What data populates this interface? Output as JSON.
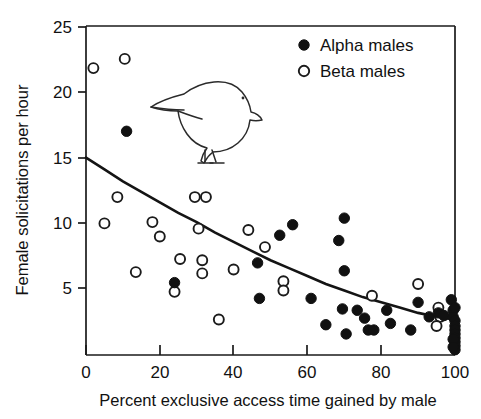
{
  "chart_data": {
    "type": "scatter",
    "title": "",
    "xlabel": "Percent exclusive access time gained by male",
    "ylabel": "Female solicitations per hour",
    "xlim": [
      0,
      100
    ],
    "ylim": [
      0,
      25
    ],
    "xticks": [
      0,
      20,
      40,
      60,
      80,
      100
    ],
    "yticks": [
      5,
      10,
      15,
      20,
      25
    ],
    "grid": false,
    "legend_position": "top-right",
    "legend": [
      {
        "label": "Alpha males",
        "marker": "filled-circle",
        "color": "#111111"
      },
      {
        "label": "Beta males",
        "marker": "open-circle",
        "color": "#ffffff"
      }
    ],
    "series": [
      {
        "name": "Alpha males",
        "marker": "filled-circle",
        "points": [
          [
            11.0,
            17.0
          ],
          [
            24.0,
            5.5
          ],
          [
            46.5,
            7.0
          ],
          [
            47.0,
            4.3
          ],
          [
            52.5,
            9.1
          ],
          [
            56.0,
            9.9
          ],
          [
            61.0,
            4.3
          ],
          [
            65.0,
            2.3
          ],
          [
            68.5,
            8.7
          ],
          [
            69.5,
            3.5
          ],
          [
            70.0,
            10.4
          ],
          [
            70.0,
            6.4
          ],
          [
            70.5,
            1.6
          ],
          [
            73.5,
            3.4
          ],
          [
            75.5,
            2.8
          ],
          [
            76.5,
            1.9
          ],
          [
            78.0,
            1.9
          ],
          [
            81.5,
            3.4
          ],
          [
            82.5,
            2.4
          ],
          [
            88.0,
            1.9
          ],
          [
            90.0,
            4.0
          ],
          [
            93.0,
            2.9
          ],
          [
            95.5,
            3.2
          ],
          [
            97.0,
            3.0
          ],
          [
            99.0,
            4.2
          ],
          [
            99.5,
            3.4
          ],
          [
            99.5,
            2.9
          ],
          [
            100.0,
            3.6
          ],
          [
            100.0,
            2.6
          ],
          [
            100.0,
            2.2
          ],
          [
            100.0,
            1.9
          ],
          [
            100.0,
            1.6
          ],
          [
            100.0,
            1.3
          ],
          [
            100.0,
            1.0
          ],
          [
            100.0,
            0.7
          ],
          [
            100.0,
            0.4
          ],
          [
            99.5,
            1.2
          ],
          [
            99.5,
            0.6
          ]
        ]
      },
      {
        "name": "Beta males",
        "marker": "open-circle",
        "points": [
          [
            2.0,
            21.8
          ],
          [
            10.5,
            22.5
          ],
          [
            5.0,
            10.0
          ],
          [
            8.5,
            12.0
          ],
          [
            13.5,
            6.3
          ],
          [
            18.0,
            10.1
          ],
          [
            20.0,
            9.0
          ],
          [
            24.0,
            4.8
          ],
          [
            25.5,
            7.3
          ],
          [
            29.5,
            12.0
          ],
          [
            30.5,
            9.6
          ],
          [
            31.5,
            7.2
          ],
          [
            31.5,
            6.2
          ],
          [
            32.5,
            12.0
          ],
          [
            36.0,
            2.7
          ],
          [
            40.0,
            6.5
          ],
          [
            44.0,
            9.5
          ],
          [
            48.5,
            8.2
          ],
          [
            53.5,
            5.6
          ],
          [
            53.5,
            4.9
          ],
          [
            77.5,
            4.5
          ],
          [
            90.0,
            5.4
          ],
          [
            95.5,
            3.6
          ],
          [
            96.0,
            2.9
          ],
          [
            95.0,
            2.2
          ]
        ]
      }
    ],
    "fit_curve": {
      "name": "exponential decay fit",
      "description": "Declining curve from 15 at x=0 to about 2.7 at x=100",
      "points": [
        [
          0,
          15.0
        ],
        [
          5,
          14.1
        ],
        [
          10,
          13.2
        ],
        [
          15,
          12.4
        ],
        [
          20,
          11.6
        ],
        [
          25,
          10.8
        ],
        [
          30,
          10.1
        ],
        [
          35,
          9.3
        ],
        [
          40,
          8.6
        ],
        [
          45,
          7.9
        ],
        [
          50,
          7.2
        ],
        [
          55,
          6.6
        ],
        [
          60,
          6.0
        ],
        [
          65,
          5.4
        ],
        [
          70,
          4.9
        ],
        [
          75,
          4.4
        ],
        [
          80,
          4.0
        ],
        [
          85,
          3.6
        ],
        [
          90,
          3.2
        ],
        [
          95,
          2.9
        ],
        [
          100,
          2.7
        ]
      ]
    },
    "annotations": [
      {
        "type": "illustration",
        "name": "bird-drawing",
        "description": "Line drawing of a small perching bird facing right"
      }
    ]
  },
  "axes": {
    "x_title": "Percent exclusive access time gained by male",
    "y_title": "Female solicitations per hour",
    "x_tick_labels": [
      "0",
      "20",
      "40",
      "60",
      "80",
      "100"
    ],
    "y_tick_labels": [
      "5",
      "10",
      "15",
      "20",
      "25"
    ]
  },
  "legend": {
    "alpha_label": "Alpha males",
    "beta_label": "Beta males"
  },
  "colors": {
    "axis": "#1a1a1a",
    "alpha_marker": "#111111",
    "beta_marker": "#ffffff",
    "curve": "#141414",
    "background": "#ffffff"
  }
}
